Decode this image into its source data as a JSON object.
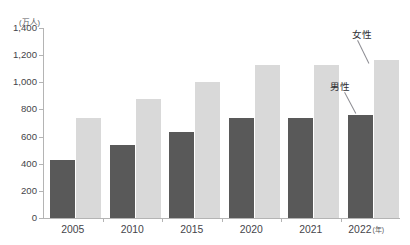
{
  "chart_data": {
    "type": "bar",
    "title": "",
    "partial_top_text": "",
    "xlabel": "年",
    "ylabel": "",
    "unit_label": "(万人)",
    "categories": [
      "2005",
      "2010",
      "2015",
      "2020",
      "2021",
      "2022"
    ],
    "ylim": [
      0,
      1400
    ],
    "ytick_values": [
      0,
      200,
      400,
      600,
      800,
      1000,
      1200,
      1400
    ],
    "ytick_labels": [
      "0",
      "200",
      "400",
      "600",
      "800",
      "1,000",
      "1,200",
      "1,400"
    ],
    "grid": false,
    "legend_position": "inline-annotations",
    "series": [
      {
        "name": "男性",
        "color": "#595959",
        "values": [
          430,
          535,
          635,
          735,
          735,
          760
        ]
      },
      {
        "name": "女性",
        "color": "#d9d9d9",
        "values": [
          735,
          880,
          1005,
          1130,
          1130,
          1165
        ]
      }
    ],
    "annotations": [
      {
        "text": "女性",
        "target_series": "女性",
        "target_category": "2022"
      },
      {
        "text": "男性",
        "target_series": "男性",
        "target_category": "2022"
      }
    ]
  },
  "axis": {
    "x_unit_suffix": "(年)"
  }
}
